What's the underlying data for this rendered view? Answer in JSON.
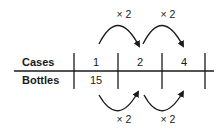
{
  "diagram": {
    "type": "ratio-table",
    "rows": [
      {
        "label": "Cases",
        "values": [
          "1",
          "2",
          "4"
        ]
      },
      {
        "label": "Bottles",
        "values": [
          "15",
          "",
          ""
        ]
      }
    ],
    "top_arrows": [
      {
        "from_col": 0,
        "to_col": 1,
        "label": "× 2"
      },
      {
        "from_col": 1,
        "to_col": 2,
        "label": "× 2"
      }
    ],
    "bottom_arrows": [
      {
        "from_col": 0,
        "to_col": 1,
        "label": "× 2"
      },
      {
        "from_col": 1,
        "to_col": 2,
        "label": "× 2"
      }
    ],
    "colors": {
      "line": "#1a1a1a",
      "text": "#1a1a1a"
    }
  }
}
